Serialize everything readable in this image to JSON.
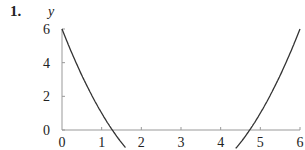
{
  "problem_number": "1.",
  "chart_data": {
    "type": "line",
    "title": "",
    "xlabel": "",
    "ylabel": "y",
    "xlim": [
      0,
      6
    ],
    "ylim": [
      0,
      6
    ],
    "x_ticks": [
      "0",
      "1",
      "2",
      "3",
      "4",
      "5",
      "6"
    ],
    "y_ticks": [
      "0",
      "2",
      "4",
      "6"
    ],
    "grid": false,
    "series": [
      {
        "name": "y = x^2 - 6x + 6",
        "x": [
          0,
          0.5,
          1,
          1.268,
          1.6,
          4.4,
          4.732,
          5,
          5.5,
          6
        ],
        "y": [
          6,
          3.25,
          1,
          0,
          -1.04,
          -1.04,
          0,
          1,
          3.25,
          6
        ]
      }
    ],
    "colors": {
      "curve": "#333333",
      "axis": "#999999",
      "text": "#222222"
    }
  }
}
